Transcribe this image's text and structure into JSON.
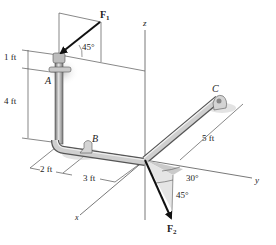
{
  "diagram": {
    "type": "statics-3d-pipe",
    "axes": {
      "x": "x",
      "y": "y",
      "z": "z"
    },
    "points": {
      "A": "A",
      "B": "B",
      "C": "C"
    },
    "forces": {
      "F1": {
        "symbol": "F",
        "sub": "1",
        "angle": "45°"
      },
      "F2": {
        "symbol": "F",
        "sub": "2",
        "angle_horizontal": "30°",
        "angle_vertical": "45°"
      }
    },
    "dimensions": {
      "d1": "1 ft",
      "d4": "4 ft",
      "d2": "2 ft",
      "d3": "3 ft",
      "d5": "5 ft"
    },
    "colors": {
      "pipe": "#8a8a8a",
      "pipe_highlight": "#d8d8d8",
      "line": "#444444",
      "force": "#111111",
      "shade": "#d6d6d6"
    }
  }
}
